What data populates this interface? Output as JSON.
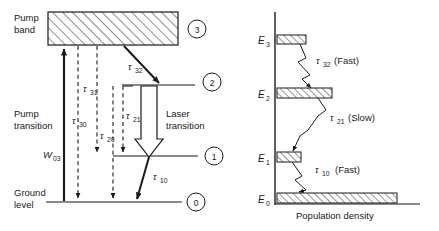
{
  "figure": {
    "background_color": "#ffffff",
    "line_color": "#1a1a1a",
    "hatch_color": "#1a1a1a"
  },
  "left_panel": {
    "name": "four-level-laser-energy-diagram",
    "labels": {
      "pump_band_line1": "Pump",
      "pump_band_line2": "band",
      "pump_transition_line1": "Pump",
      "pump_transition_line2": "transition",
      "laser_transition_line1": "Laser",
      "laser_transition_line2": "transition",
      "ground_level_line1": "Ground",
      "ground_level_line2": "level"
    },
    "pump_rate": {
      "symbol": "W",
      "sub": "03"
    },
    "decay_paths": [
      {
        "symbol": "τ",
        "sub": "32",
        "style": "solid-arrow",
        "from_level": 3,
        "to_level": 2
      },
      {
        "symbol": "τ",
        "sub": "31",
        "style": "dashed-arrow",
        "from_level": 3,
        "to_level": 1
      },
      {
        "symbol": "τ",
        "sub": "30",
        "style": "dashed-arrow",
        "from_level": 3,
        "to_level": 0
      },
      {
        "symbol": "τ",
        "sub": "21",
        "style": "dashed-arrow",
        "from_level": 2,
        "to_level": 1
      },
      {
        "symbol": "τ",
        "sub": "20",
        "style": "dashed-arrow",
        "from_level": 2,
        "to_level": 0
      },
      {
        "symbol": "τ",
        "sub": "10",
        "style": "solid-arrow",
        "from_level": 1,
        "to_level": 0
      }
    ],
    "level_badges": [
      "3",
      "2",
      "1",
      "0"
    ]
  },
  "right_panel": {
    "name": "population-density-diagram",
    "axis_label": "Population density",
    "energy_levels": [
      {
        "symbol": "E",
        "sub": "3",
        "population_width": 29
      },
      {
        "symbol": "E",
        "sub": "2",
        "population_width": 55
      },
      {
        "symbol": "E",
        "sub": "1",
        "population_width": 24
      },
      {
        "symbol": "E",
        "sub": "0",
        "population_width": 120
      }
    ],
    "transitions": [
      {
        "symbol": "τ",
        "sub": "32",
        "speed": "(Fast)"
      },
      {
        "symbol": "τ",
        "sub": "21",
        "speed": "(Slow)"
      },
      {
        "symbol": "τ",
        "sub": "10",
        "speed": "(Fast)"
      }
    ]
  }
}
